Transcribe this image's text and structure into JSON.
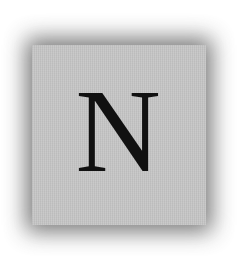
{
  "tile": {
    "letter": "N",
    "face_color": "#c6c6c6",
    "shadow_color": "#6a6a6a",
    "letter_color": "#111111"
  }
}
